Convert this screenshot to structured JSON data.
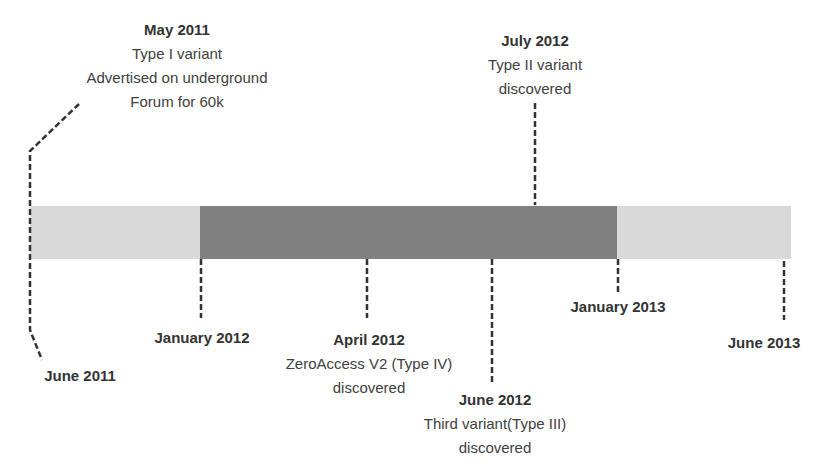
{
  "diagram": {
    "type": "timeline",
    "colors": {
      "bar_light": "#d9d9d9",
      "bar_dark": "#808080",
      "text": "#404040"
    },
    "segments": [
      {
        "label": "",
        "from": "June 2011",
        "to": "January 2012",
        "shade": "light"
      },
      {
        "label": "",
        "from": "January 2012",
        "to": "January 2013",
        "shade": "dark"
      },
      {
        "label": "",
        "from": "January 2013",
        "to": "June 2013",
        "shade": "light"
      }
    ],
    "events": [
      {
        "date": "May 2011",
        "lines": [
          "Type I variant",
          "Advertised on underground",
          "Forum for 60k"
        ],
        "position": "above"
      },
      {
        "date": "July 2012",
        "lines": [
          "Type II variant",
          "discovered"
        ],
        "position": "above"
      },
      {
        "date": "June 2011",
        "lines": [],
        "position": "below"
      },
      {
        "date": "January 2012",
        "lines": [],
        "position": "below"
      },
      {
        "date": "April 2012",
        "lines": [
          "ZeroAccess V2 (Type IV)",
          "discovered"
        ],
        "position": "below"
      },
      {
        "date": "June 2012",
        "lines": [
          "Third variant(Type III)",
          "discovered"
        ],
        "position": "below"
      },
      {
        "date": "January 2013",
        "lines": [],
        "position": "below"
      },
      {
        "date": "June 2013",
        "lines": [],
        "position": "below"
      }
    ]
  }
}
